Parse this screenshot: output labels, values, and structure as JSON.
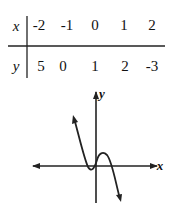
{
  "table": {
    "row_labels": [
      "x",
      "y"
    ],
    "x_values": [
      "-2",
      "-1",
      "0",
      "1",
      "2"
    ],
    "y_values": [
      "5",
      "0",
      "1",
      "2",
      "-3"
    ]
  },
  "graph": {
    "x_axis_label": "x",
    "y_axis_label": "y",
    "description": "Cubic-like curve: descends from upper left, local min near origin on the left, local max just right of y-axis, then descends to lower right"
  }
}
